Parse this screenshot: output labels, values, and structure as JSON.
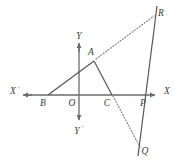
{
  "figure": {
    "width": 175,
    "height": 163,
    "background_color": "#ffffff",
    "stroke_color": "#555555",
    "axis_color": "#6a6a6a",
    "label_color": "#3b3b3b"
  },
  "axes": {
    "x_axis": {
      "label_positive": "X",
      "label_negative": "X",
      "negative_prime": "'",
      "y_position": 95,
      "x_start": 22,
      "x_end": 160
    },
    "y_axis": {
      "label_positive": "Y",
      "label_negative": "Y",
      "negative_prime": "'",
      "x_position": 79,
      "y_start": 42,
      "y_end": 125
    }
  },
  "points": [
    {
      "name": "O",
      "label": "O",
      "x": 79,
      "y": 95,
      "label_x": 72,
      "label_y": 104
    },
    {
      "name": "A",
      "label": "A",
      "x": 94,
      "y": 61,
      "label_x": 89,
      "label_y": 55
    },
    {
      "name": "B",
      "label": "B",
      "x": 48,
      "y": 95,
      "label_x": 43,
      "label_y": 105
    },
    {
      "name": "C",
      "label": "C",
      "x": 112,
      "y": 95,
      "label_x": 106,
      "label_y": 105
    },
    {
      "name": "P",
      "label": "P",
      "x": 146,
      "y": 95,
      "label_x": 141,
      "label_y": 105
    },
    {
      "name": "R",
      "label": "R",
      "x": 155,
      "y": 13,
      "label_x": 158,
      "label_y": 13
    },
    {
      "name": "Q",
      "label": "Q",
      "x": 140,
      "y": 146,
      "label_x": 142,
      "label_y": 152
    }
  ],
  "solid_segments": [
    {
      "name": "segment-BA",
      "from": "B",
      "to": "A"
    },
    {
      "name": "segment-AC",
      "from": "A",
      "to": "C"
    },
    {
      "name": "line-RQ",
      "from": "R",
      "to": "Q"
    }
  ],
  "dotted_segments": [
    {
      "name": "dotted-AR",
      "from": "A",
      "to": "R"
    },
    {
      "name": "dotted-CQ",
      "from": "C",
      "to": "Q"
    }
  ],
  "labels": {
    "x_positive": "X",
    "x_negative": "X",
    "y_positive": "Y",
    "y_negative": "Y",
    "prime": "'"
  }
}
